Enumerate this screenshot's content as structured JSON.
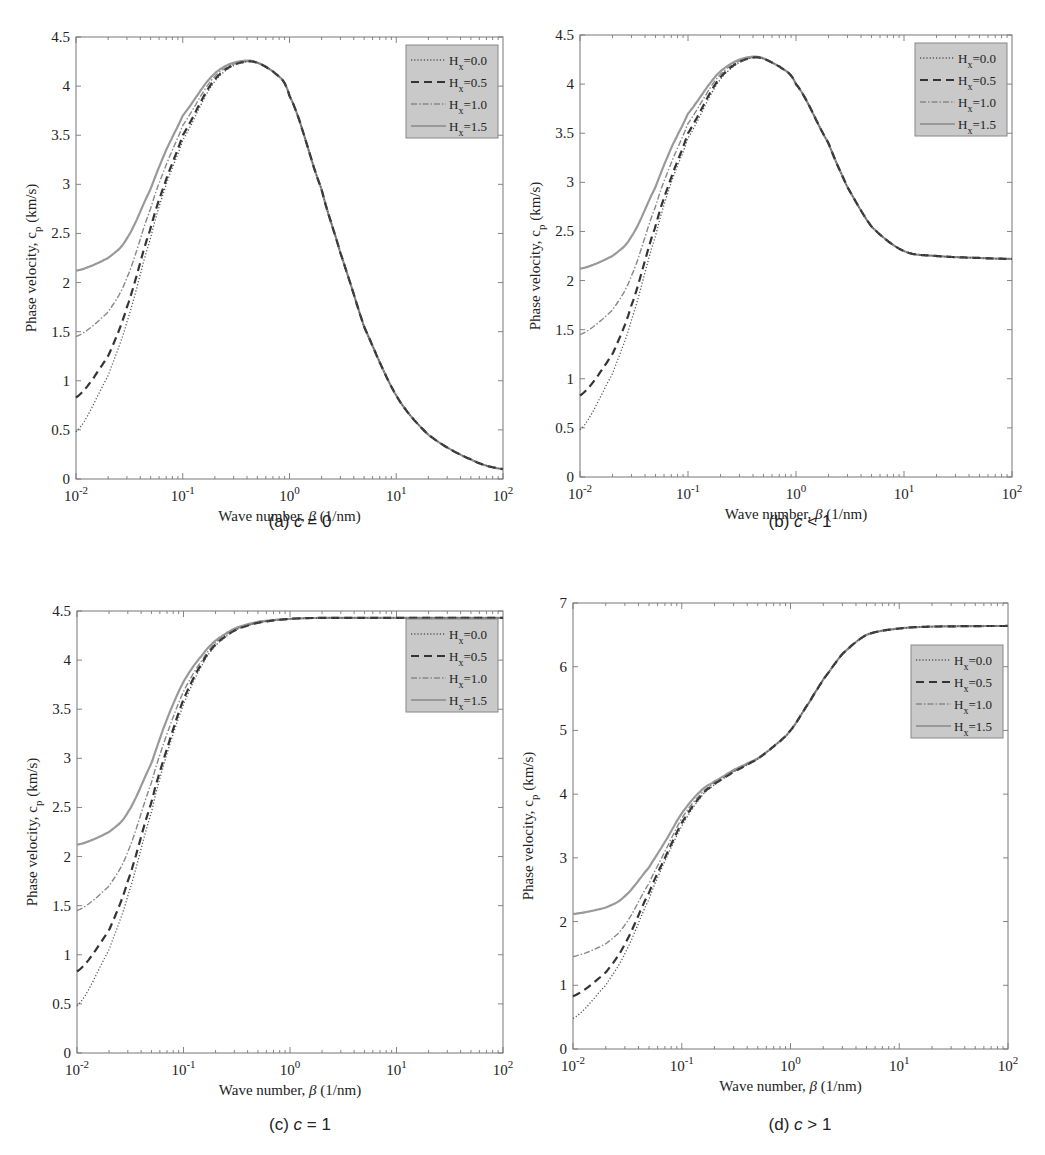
{
  "figure": {
    "legend_labels": [
      "H_x=0.0",
      "H_x=0.5",
      "H_x=1.0",
      "H_x=1.5"
    ],
    "ylabel": "Phase velocity, c_p (km/s)",
    "xlabel": "Wave number, β (1/nm)",
    "xticks": [
      "10^-2",
      "10^-1",
      "10^0",
      "10^1",
      "10^2"
    ]
  },
  "panels": [
    {
      "id": "a",
      "caption_prefix": "(a) ",
      "caption_var": "c",
      "caption_rel": " = 0"
    },
    {
      "id": "b",
      "caption_prefix": "(b) ",
      "caption_var": "c",
      "caption_rel": " < 1"
    },
    {
      "id": "c",
      "caption_prefix": "(c) ",
      "caption_var": "c",
      "caption_rel": " = 1"
    },
    {
      "id": "d",
      "caption_prefix": "(d) ",
      "caption_var": "c",
      "caption_rel": " > 1"
    }
  ],
  "chart_data": [
    {
      "type": "line",
      "title": "(a) c = 0",
      "xlabel": "Wave number, β (1/nm)",
      "ylabel": "Phase velocity, c_p (km/s)",
      "xscale": "log",
      "xlim": [
        0.01,
        100
      ],
      "ylim": [
        0,
        4.5
      ],
      "yticks": [
        0,
        0.5,
        1,
        1.5,
        2,
        2.5,
        3,
        3.5,
        4,
        4.5
      ],
      "legend_position": "upper right",
      "x": [
        0.01,
        0.02,
        0.03,
        0.05,
        0.07,
        0.1,
        0.2,
        0.4,
        0.7,
        1,
        2,
        3,
        5,
        10,
        20,
        50,
        100
      ],
      "series": [
        {
          "name": "H_x=0.0",
          "style": "dotted",
          "values": [
            0.48,
            1.05,
            1.6,
            2.45,
            3.0,
            3.45,
            4.05,
            4.25,
            4.15,
            3.9,
            2.95,
            2.3,
            1.55,
            0.85,
            0.45,
            0.2,
            0.1
          ]
        },
        {
          "name": "H_x=0.5",
          "style": "dashed",
          "values": [
            0.83,
            1.25,
            1.75,
            2.55,
            3.05,
            3.5,
            4.07,
            4.25,
            4.15,
            3.9,
            2.95,
            2.3,
            1.55,
            0.85,
            0.45,
            0.2,
            0.1
          ]
        },
        {
          "name": "H_x=1.0",
          "style": "dash-dot",
          "values": [
            1.45,
            1.7,
            2.05,
            2.75,
            3.2,
            3.6,
            4.1,
            4.25,
            4.15,
            3.9,
            2.95,
            2.3,
            1.55,
            0.85,
            0.45,
            0.2,
            0.1
          ]
        },
        {
          "name": "H_x=1.5",
          "style": "solid",
          "values": [
            2.12,
            2.25,
            2.45,
            2.95,
            3.35,
            3.7,
            4.13,
            4.26,
            4.15,
            3.9,
            2.95,
            2.3,
            1.55,
            0.85,
            0.45,
            0.2,
            0.1
          ]
        }
      ]
    },
    {
      "type": "line",
      "title": "(b) c < 1",
      "xlabel": "Wave number, β (1/nm)",
      "ylabel": "Phase velocity, c_p (km/s)",
      "xscale": "log",
      "xlim": [
        0.01,
        100
      ],
      "ylim": [
        0,
        4.5
      ],
      "yticks": [
        0,
        0.5,
        1,
        1.5,
        2,
        2.5,
        3,
        3.5,
        4,
        4.5
      ],
      "legend_position": "upper right",
      "x": [
        0.01,
        0.02,
        0.03,
        0.05,
        0.07,
        0.1,
        0.2,
        0.4,
        0.7,
        1,
        2,
        3,
        5,
        10,
        20,
        50,
        100
      ],
      "series": [
        {
          "name": "H_x=0.0",
          "style": "dotted",
          "values": [
            0.48,
            1.05,
            1.6,
            2.45,
            3.0,
            3.45,
            4.05,
            4.27,
            4.18,
            4.0,
            3.4,
            2.95,
            2.55,
            2.3,
            2.25,
            2.23,
            2.22
          ]
        },
        {
          "name": "H_x=0.5",
          "style": "dashed",
          "values": [
            0.83,
            1.25,
            1.75,
            2.55,
            3.05,
            3.5,
            4.07,
            4.27,
            4.18,
            4.0,
            3.4,
            2.95,
            2.55,
            2.3,
            2.25,
            2.23,
            2.22
          ]
        },
        {
          "name": "H_x=1.0",
          "style": "dash-dot",
          "values": [
            1.45,
            1.7,
            2.05,
            2.75,
            3.2,
            3.6,
            4.1,
            4.27,
            4.18,
            4.0,
            3.4,
            2.95,
            2.55,
            2.3,
            2.25,
            2.23,
            2.22
          ]
        },
        {
          "name": "H_x=1.5",
          "style": "solid",
          "values": [
            2.12,
            2.25,
            2.45,
            2.95,
            3.35,
            3.7,
            4.13,
            4.28,
            4.18,
            4.0,
            3.4,
            2.95,
            2.55,
            2.3,
            2.25,
            2.23,
            2.22
          ]
        }
      ]
    },
    {
      "type": "line",
      "title": "(c) c = 1",
      "xlabel": "Wave number, β (1/nm)",
      "ylabel": "Phase velocity, c_p (km/s)",
      "xscale": "log",
      "xlim": [
        0.01,
        100
      ],
      "ylim": [
        0,
        4.5
      ],
      "yticks": [
        0,
        0.5,
        1,
        1.5,
        2,
        2.5,
        3,
        3.5,
        4,
        4.5
      ],
      "legend_position": "upper right",
      "x": [
        0.01,
        0.02,
        0.03,
        0.05,
        0.07,
        0.1,
        0.15,
        0.2,
        0.3,
        0.5,
        1,
        2,
        5,
        10,
        100
      ],
      "series": [
        {
          "name": "H_x=0.0",
          "style": "dotted",
          "values": [
            0.48,
            1.05,
            1.6,
            2.45,
            3.05,
            3.55,
            3.95,
            4.15,
            4.3,
            4.38,
            4.42,
            4.43,
            4.43,
            4.43,
            4.43
          ]
        },
        {
          "name": "H_x=0.5",
          "style": "dashed",
          "values": [
            0.83,
            1.25,
            1.75,
            2.55,
            3.1,
            3.6,
            3.97,
            4.16,
            4.3,
            4.38,
            4.42,
            4.43,
            4.43,
            4.43,
            4.43
          ]
        },
        {
          "name": "H_x=1.0",
          "style": "dash-dot",
          "values": [
            1.45,
            1.7,
            2.05,
            2.75,
            3.25,
            3.68,
            4.0,
            4.18,
            4.31,
            4.38,
            4.42,
            4.43,
            4.43,
            4.43,
            4.43
          ]
        },
        {
          "name": "H_x=1.5",
          "style": "solid",
          "values": [
            2.12,
            2.25,
            2.45,
            2.95,
            3.4,
            3.78,
            4.05,
            4.2,
            4.32,
            4.39,
            4.42,
            4.43,
            4.43,
            4.43,
            4.43
          ]
        }
      ]
    },
    {
      "type": "line",
      "title": "(d) c > 1",
      "xlabel": "Wave number, β (1/nm)",
      "ylabel": "Phase velocity, c_p (km/s)",
      "xscale": "log",
      "xlim": [
        0.01,
        100
      ],
      "ylim": [
        0,
        7
      ],
      "yticks": [
        0,
        1,
        2,
        3,
        4,
        5,
        6,
        7
      ],
      "legend_position": "upper right",
      "x": [
        0.01,
        0.02,
        0.03,
        0.05,
        0.07,
        0.1,
        0.15,
        0.2,
        0.3,
        0.5,
        0.7,
        1,
        1.5,
        2,
        3,
        5,
        10,
        20,
        100
      ],
      "series": [
        {
          "name": "H_x=0.0",
          "style": "dotted",
          "values": [
            0.48,
            1.0,
            1.5,
            2.35,
            2.95,
            3.5,
            3.95,
            4.15,
            4.35,
            4.55,
            4.75,
            5.0,
            5.45,
            5.8,
            6.2,
            6.5,
            6.6,
            6.63,
            6.64
          ]
        },
        {
          "name": "H_x=0.5",
          "style": "dashed",
          "values": [
            0.83,
            1.2,
            1.65,
            2.45,
            3.0,
            3.55,
            3.97,
            4.16,
            4.35,
            4.55,
            4.75,
            5.0,
            5.45,
            5.8,
            6.2,
            6.5,
            6.6,
            6.63,
            6.64
          ]
        },
        {
          "name": "H_x=1.0",
          "style": "dash-dot",
          "values": [
            1.45,
            1.65,
            1.95,
            2.6,
            3.1,
            3.62,
            4.0,
            4.18,
            4.36,
            4.55,
            4.75,
            5.0,
            5.45,
            5.8,
            6.2,
            6.5,
            6.6,
            6.63,
            6.64
          ]
        },
        {
          "name": "H_x=1.5",
          "style": "solid",
          "values": [
            2.12,
            2.22,
            2.4,
            2.85,
            3.25,
            3.7,
            4.05,
            4.2,
            4.38,
            4.56,
            4.75,
            5.0,
            5.45,
            5.8,
            6.2,
            6.5,
            6.6,
            6.63,
            6.64
          ]
        }
      ]
    }
  ]
}
